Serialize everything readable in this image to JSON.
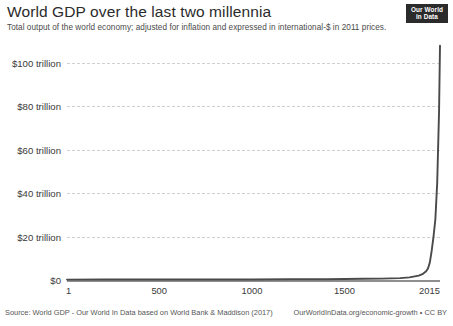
{
  "header": {
    "title": "World GDP over the last two millennia",
    "subtitle": "Total output of the world economy; adjusted for inflation and expressed in international-$ in 2011 prices."
  },
  "logo": {
    "line1": "Our World",
    "line2": "in Data"
  },
  "footer": {
    "source": "Source: World GDP - Our World In Data based on World Bank & Maddison (2017)",
    "link": "OurWorldInData.org/economic-growth • CC BY"
  },
  "colors": {
    "line": "#4a4a4a",
    "grid": "#d0d0d0",
    "axis": "#8f8f8f",
    "text": "#3a3a3a",
    "logo_bg": "#2b2b2b"
  },
  "chart_data": {
    "type": "line",
    "title": "World GDP over the last two millennia",
    "subtitle": "Total output of the world economy; adjusted for inflation and expressed in international-$ in 2011 prices.",
    "xlabel": "",
    "ylabel": "",
    "xlim": [
      1,
      2015
    ],
    "ylim": [
      0,
      110
    ],
    "y_unit": "trillion international-$ (2011 prices)",
    "grid": true,
    "legend": false,
    "y_ticks": [
      0,
      20,
      40,
      60,
      80,
      100
    ],
    "y_tick_labels": [
      "$0",
      "$20 trillion",
      "$40 trillion",
      "$60 trillion",
      "$80 trillion",
      "$100 trillion"
    ],
    "x_ticks": [
      1,
      500,
      1000,
      1500,
      2015
    ],
    "x_tick_labels": [
      "1",
      "500",
      "1000",
      "1500",
      "2015"
    ],
    "series": [
      {
        "name": "World GDP",
        "x": [
          1,
          200,
          400,
          600,
          800,
          1000,
          1200,
          1400,
          1500,
          1600,
          1700,
          1800,
          1850,
          1900,
          1920,
          1940,
          1950,
          1960,
          1970,
          1980,
          1990,
          2000,
          2010,
          2015
        ],
        "values": [
          0.18,
          0.2,
          0.2,
          0.21,
          0.23,
          0.25,
          0.33,
          0.33,
          0.43,
          0.58,
          0.64,
          0.87,
          1.2,
          2.0,
          2.7,
          4.0,
          5.3,
          8.0,
          13.4,
          20.0,
          28.0,
          45.0,
          78.0,
          108.0
        ]
      }
    ]
  }
}
